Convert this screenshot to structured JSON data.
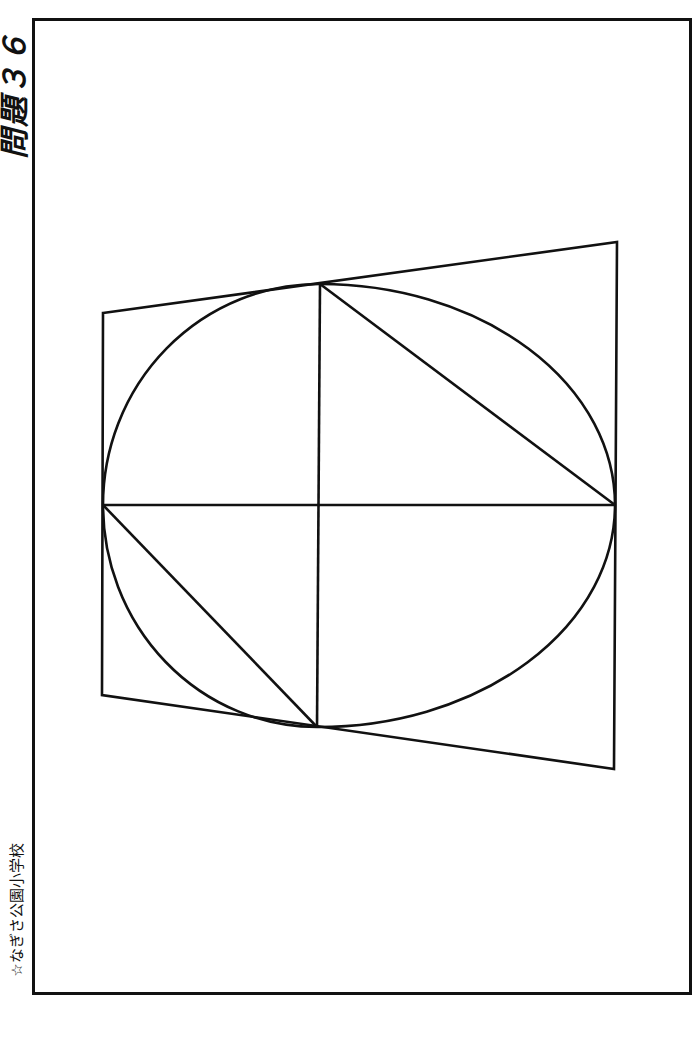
{
  "header": {
    "title": "問題３６"
  },
  "footer": {
    "school": "☆なぎさ公園小学校"
  },
  "figure": {
    "stroke": "#111111",
    "quadrilateral": [
      [
        103,
        313
      ],
      [
        617,
        242
      ],
      [
        614,
        769
      ],
      [
        102,
        695
      ]
    ],
    "center": [
      318,
      505
    ],
    "ellipse_extents": {
      "left": 103,
      "right": 615,
      "top": 284,
      "bottom": 727
    },
    "lines": [
      [
        [
          103,
          505
        ],
        [
          615,
          505
        ]
      ],
      [
        [
          320,
          284
        ],
        [
          317,
          727
        ]
      ],
      [
        [
          320,
          284
        ],
        [
          615,
          505
        ]
      ],
      [
        [
          103,
          505
        ],
        [
          317,
          727
        ]
      ]
    ]
  }
}
